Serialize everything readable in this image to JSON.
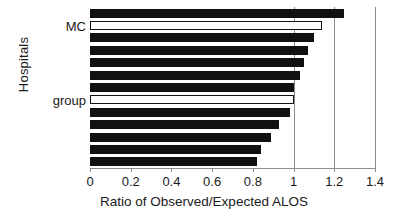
{
  "chart_data": {
    "type": "bar",
    "orientation": "horizontal",
    "title": "",
    "xlabel": "Ratio of Observed/Expected ALOS",
    "ylabel": "Hospitals",
    "xlim": [
      0,
      1.4
    ],
    "xticks": [
      0,
      0.2,
      0.4,
      0.6,
      0.8,
      1,
      1.2,
      1.4
    ],
    "xtick_labels": [
      "0",
      "0.2",
      "0.4",
      "0.6",
      "0.8",
      "1",
      "1.2",
      "1.4"
    ],
    "gridlines": [
      1,
      1.2,
      1.4
    ],
    "grid": true,
    "legend": "none",
    "categories": [
      "hospital-1",
      "MC",
      "hospital-3",
      "hospital-4",
      "hospital-5",
      "hospital-6",
      "hospital-7",
      "group",
      "hospital-9",
      "hospital-10",
      "hospital-11",
      "hospital-12",
      "hospital-13"
    ],
    "values": [
      1.25,
      1.14,
      1.1,
      1.07,
      1.05,
      1.03,
      1.0,
      1.0,
      0.98,
      0.93,
      0.89,
      0.84,
      0.82
    ],
    "styles": [
      "filled",
      "hollow",
      "filled",
      "filled",
      "filled",
      "filled",
      "filled",
      "hollow",
      "filled",
      "filled",
      "filled",
      "filled",
      "filled"
    ],
    "labeled_bars": [
      {
        "index": 1,
        "label": "MC"
      },
      {
        "index": 7,
        "label": "group"
      }
    ],
    "colors": {
      "bar_fill": "#111111",
      "bar_hollow_fill": "#ffffff",
      "bar_outline": "#111111",
      "axis": "#8c8c8c",
      "text": "#1a1a1a",
      "background": "#ffffff"
    }
  }
}
